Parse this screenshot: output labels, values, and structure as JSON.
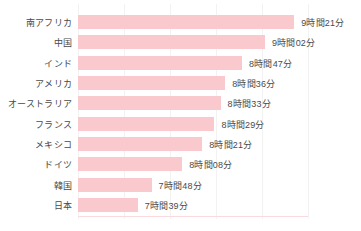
{
  "chart_data": {
    "type": "bar",
    "orientation": "horizontal",
    "title": "",
    "subtitle": "",
    "xlabel": "",
    "ylabel": "",
    "grid": true,
    "legend": null,
    "value_unit": "時間分",
    "xlim_minutes": [
      420,
      570
    ],
    "categories": [
      "南アフリカ",
      "中国",
      "インド",
      "アメリカ",
      "オーストラリア",
      "フランス",
      "メキシコ",
      "ドイツ",
      "韓国",
      "日本"
    ],
    "values": [
      561,
      542,
      527,
      516,
      513,
      509,
      501,
      488,
      468,
      459
    ],
    "value_labels": [
      "9時間21分",
      "9時間02分",
      "8時間47分",
      "8時間36分",
      "8時間33分",
      "8時間29分",
      "8時間21分",
      "8時間08分",
      "7時間48分",
      "7時間39分"
    ],
    "bar_color": "#f9c9cd",
    "grid_color": "#f2f2f2",
    "text_color": "#4a4a4a",
    "background_color": "#ffffff"
  }
}
